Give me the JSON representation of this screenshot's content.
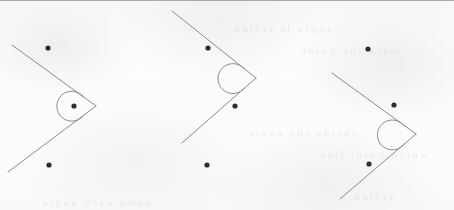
{
  "sheet": {
    "width": 454,
    "height": 210,
    "paper_color": "#fcfcfc",
    "ink_color": "#8b8b90",
    "dot_color": "#2e2e32",
    "edge_rule_color": "#9a9aa0",
    "description": "Scanned geometry worksheet fragment showing three identical reflex-angle figures"
  },
  "bleedthrough": {
    "note": "faint illegible mirrored text showing through from the back of the page",
    "lines": [
      {
        "text": "angle is reflex",
        "x": 232,
        "y": 22,
        "size": 11
      },
      {
        "text": "mark the point",
        "x": 300,
        "y": 44,
        "size": 11
      },
      {
        "text": "inside the angle",
        "x": 246,
        "y": 126,
        "size": 11
      },
      {
        "text": "which point lies",
        "x": 318,
        "y": 148,
        "size": 11
      },
      {
        "text": "name each angle",
        "x": 40,
        "y": 196,
        "size": 11
      },
      {
        "text": "reflex",
        "x": 352,
        "y": 190,
        "size": 11
      }
    ]
  },
  "figures": [
    {
      "id": "figure-1",
      "label": "reflex-angle-figure-1",
      "vertex": {
        "x": 96,
        "y": 106
      },
      "upper_ray_end": {
        "x": 12,
        "y": 45
      },
      "lower_ray_end": {
        "x": 8,
        "y": 172
      },
      "arc": {
        "center": {
          "x": 105,
          "y": 106
        },
        "radius": 15,
        "sweep_description": "reflex arc drawn on the open (right) side of the vertex"
      },
      "points": [
        {
          "id": "p1",
          "x": 48,
          "y": 48,
          "r": 2.6
        },
        {
          "id": "p2",
          "x": 74,
          "y": 106,
          "r": 2.6
        },
        {
          "id": "p3",
          "x": 49,
          "y": 165,
          "r": 2.6
        }
      ]
    },
    {
      "id": "figure-2",
      "label": "reflex-angle-figure-2",
      "vertex": {
        "x": 256,
        "y": 78
      },
      "upper_ray_end": {
        "x": 172,
        "y": 11
      },
      "lower_ray_end": {
        "x": 182,
        "y": 143
      },
      "arc": {
        "center": {
          "x": 266,
          "y": 78
        },
        "radius": 15,
        "sweep_description": "reflex arc drawn on the open (right) side of the vertex"
      },
      "points": [
        {
          "id": "p1",
          "x": 208,
          "y": 48,
          "r": 2.6
        },
        {
          "id": "p2",
          "x": 235,
          "y": 106,
          "r": 2.6
        },
        {
          "id": "p3",
          "x": 207,
          "y": 165,
          "r": 2.6
        }
      ]
    },
    {
      "id": "figure-3",
      "label": "reflex-angle-figure-3",
      "vertex": {
        "x": 416,
        "y": 134
      },
      "upper_ray_end": {
        "x": 332,
        "y": 73
      },
      "lower_ray_end": {
        "x": 340,
        "y": 199
      },
      "arc": {
        "center": {
          "x": 426,
          "y": 134
        },
        "radius": 15,
        "sweep_description": "reflex arc drawn on the open (right) side of the vertex"
      },
      "points": [
        {
          "id": "p1",
          "x": 368,
          "y": 49,
          "r": 2.6
        },
        {
          "id": "p2",
          "x": 394,
          "y": 105,
          "r": 2.6
        },
        {
          "id": "p3",
          "x": 369,
          "y": 164,
          "r": 2.6
        }
      ]
    }
  ]
}
